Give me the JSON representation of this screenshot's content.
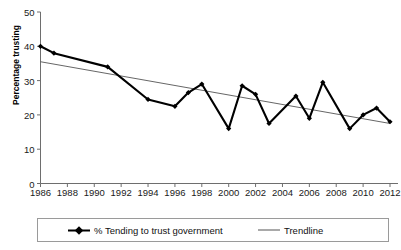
{
  "chart_data": {
    "type": "line",
    "title": "",
    "xlabel": "",
    "ylabel": "Percentage trusting",
    "xlim": [
      1986,
      2012
    ],
    "ylim": [
      0,
      50
    ],
    "ytick_labels": [
      "0",
      "10",
      "20",
      "30",
      "40",
      "50"
    ],
    "ytick_values": [
      0,
      10,
      20,
      30,
      40,
      50
    ],
    "xtick_labels": [
      "1986",
      "1988",
      "1990",
      "1992",
      "1994",
      "1996",
      "1998",
      "2000",
      "2002",
      "2004",
      "2006",
      "2008",
      "2010",
      "2012"
    ],
    "xtick_values": [
      1986,
      1988,
      1990,
      1992,
      1994,
      1996,
      1998,
      2000,
      2002,
      2004,
      2006,
      2008,
      2010,
      2012
    ],
    "grid": false,
    "legend_position": "bottom",
    "x": [
      1986,
      1987,
      1991,
      1994,
      1996,
      1997,
      1998,
      2000,
      2001,
      2002,
      2003,
      2005,
      2006,
      2007,
      2009,
      2010,
      2011,
      2012
    ],
    "series": [
      {
        "name": "% Tending to trust government",
        "color": "#000000",
        "marker": "diamond",
        "values": [
          40,
          38,
          34,
          24.5,
          22.5,
          26.5,
          29,
          16,
          28.5,
          26,
          17.5,
          25.5,
          19,
          29.5,
          16,
          20,
          22,
          18
        ]
      },
      {
        "name": "Trendline",
        "color": "#555555",
        "marker": "none",
        "trend_endpoints": [
          {
            "x": 1986,
            "y": 35.5
          },
          {
            "x": 2012,
            "y": 17.5
          }
        ]
      }
    ]
  },
  "legend": {
    "entries": [
      {
        "label": "% Tending to trust government",
        "swatch": "series-line-diamond"
      },
      {
        "label": "Trendline",
        "swatch": "trend-line"
      }
    ]
  }
}
